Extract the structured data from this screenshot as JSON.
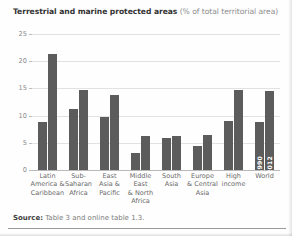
{
  "figure": {
    "title_strong": "Terrestrial and marine protected areas",
    "title_light": "(% of total territorial area)",
    "source_label": "Source:",
    "source_text": "Table 3 and online table 1.3.",
    "bar_color": "#5c5c5c",
    "grid_color": "#e2e2e2",
    "axis_color": "#b9b9b9",
    "title_color": "#333333",
    "subtitle_color": "#8c8c8c"
  },
  "chart_data": {
    "type": "bar",
    "title": "Terrestrial and marine protected areas (% of total territorial area)",
    "xlabel": "",
    "ylabel": "",
    "ylim": [
      0,
      25
    ],
    "yticks": [
      0,
      5,
      10,
      15,
      20,
      25
    ],
    "ytick_labels": [
      "0",
      "5",
      "10",
      "15",
      "20",
      "25"
    ],
    "grid": true,
    "legend_position": "in-bars-last-group",
    "categories": [
      "Latin America & Caribbean",
      "Sub-Saharan Africa",
      "East Asia & Pacific",
      "Middle East & North Africa",
      "South Asia",
      "Europe & Central Asia",
      "High income",
      "World"
    ],
    "category_lines": [
      [
        "Latin",
        "America &",
        "Caribbean"
      ],
      [
        "Sub-",
        "Saharan",
        "Africa"
      ],
      [
        "East",
        "Asia &",
        "Pacific"
      ],
      [
        "Middle East",
        "& North",
        "Africa"
      ],
      [
        "South",
        "Asia"
      ],
      [
        "Europe",
        "& Central",
        "Asia"
      ],
      [
        "High",
        "income"
      ],
      [
        "World"
      ]
    ],
    "series": [
      {
        "name": "1990",
        "values": [
          8.8,
          11.3,
          9.8,
          3.2,
          5.8,
          4.5,
          9.0,
          8.8
        ]
      },
      {
        "name": "2012",
        "values": [
          21.3,
          14.8,
          13.8,
          6.3,
          6.2,
          6.4,
          14.7,
          14.6
        ]
      }
    ],
    "annotations": [
      {
        "text": "1990",
        "on": "World",
        "series": "1990",
        "orientation": "vertical"
      },
      {
        "text": "2012",
        "on": "World",
        "series": "2012",
        "orientation": "vertical"
      }
    ]
  }
}
